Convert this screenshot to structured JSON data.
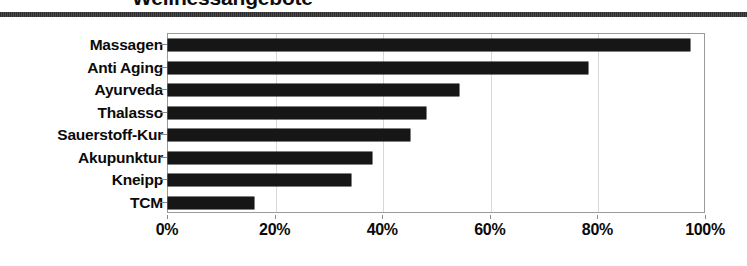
{
  "title": "Wellnessangebote",
  "chart_data": {
    "type": "bar",
    "orientation": "horizontal",
    "title": "Wellnessangebote",
    "xlabel": "",
    "ylabel": "",
    "xlim": [
      0,
      100
    ],
    "grid": true,
    "legend": false,
    "value_suffix": "%",
    "categories": [
      "Massagen",
      "Anti Aging",
      "Ayurveda",
      "Thalasso",
      "Sauerstoff-Kur",
      "Akupunktur",
      "Kneipp",
      "TCM"
    ],
    "values": [
      97,
      78,
      54,
      48,
      45,
      38,
      34,
      16
    ],
    "xticks": [
      0,
      20,
      40,
      60,
      80,
      100
    ],
    "xtick_labels": [
      "0%",
      "20%",
      "40%",
      "60%",
      "80%",
      "100%"
    ],
    "bar_color": "#161616",
    "plot_border_color": "#9a9a9a",
    "gridline_color": "#d8d8d8"
  }
}
